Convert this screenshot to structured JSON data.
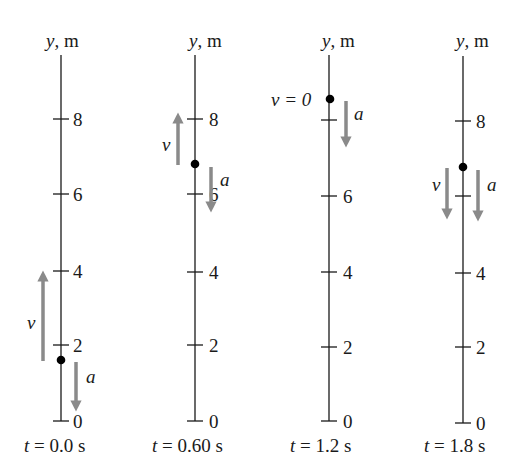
{
  "figure": {
    "axis_label_var": "y",
    "axis_label_unit": ", m",
    "tick_values": [
      "0",
      "2",
      "4",
      "6",
      "8"
    ],
    "colors": {
      "axis": "#1a1a1a",
      "arrow": "#8a8a8a",
      "dot": "#000000"
    },
    "panels": [
      {
        "time_var": "t",
        "time_eq": " = 0.0 s",
        "position_m": 1.6,
        "ticks": [
          "0",
          "2",
          "4",
          "6",
          "8"
        ],
        "velocity": {
          "label": "v",
          "direction": "up",
          "from_m": 1.8,
          "to_m": 4.3
        },
        "acceleration": {
          "label": "a",
          "direction": "down",
          "from_m": 1.5,
          "to_m": -0.1
        }
      },
      {
        "time_var": "t",
        "time_eq": " = 0.60 s",
        "position_m": 6.8,
        "ticks": [
          "0",
          "2",
          "4",
          "6",
          "8"
        ],
        "velocity": {
          "label": "v",
          "direction": "up",
          "from_m": 7.0,
          "to_m": 8.8
        },
        "acceleration": {
          "label": "a",
          "direction": "down",
          "from_m": 6.6,
          "to_m": 5.2
        }
      },
      {
        "time_var": "t",
        "time_eq": " = 1.2 s",
        "position_m": 8.6,
        "ticks": [
          "0",
          "2",
          "4",
          "6"
        ],
        "velocity": {
          "label": "v = 0",
          "direction": "none"
        },
        "acceleration": {
          "label": "a",
          "direction": "down",
          "from_m": 8.4,
          "to_m": 7.0
        }
      },
      {
        "time_var": "t",
        "time_eq": " = 1.8 s",
        "position_m": 6.7,
        "ticks": [
          "0",
          "2",
          "4",
          "8"
        ],
        "velocity": {
          "label": "v",
          "direction": "down",
          "from_m": 6.4,
          "to_m": 4.7
        },
        "acceleration": {
          "label": "a",
          "direction": "down",
          "from_m": 6.4,
          "to_m": 4.7
        }
      }
    ]
  }
}
